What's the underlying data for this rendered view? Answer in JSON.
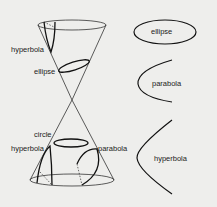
{
  "diagram": {
    "cone_labels": {
      "hyperbola_top": "hyperbola",
      "ellipse": "ellipse",
      "circle": "circle",
      "hyperbola_bottom": "hyperbola",
      "parabola": "parabola"
    },
    "shape_labels": {
      "ellipse": "ellipse",
      "parabola": "parabola",
      "hyperbola": "hyperbola"
    },
    "colors": {
      "background": "#eeeeec",
      "stroke": "#222222",
      "text": "#222222"
    }
  }
}
